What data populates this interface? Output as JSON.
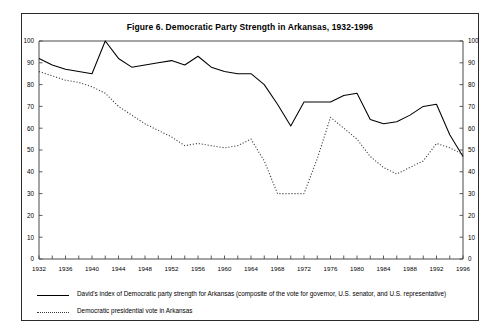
{
  "figure": {
    "title": "Figure 6.  Democratic Party Strength in Arkansas, 1932-1996"
  },
  "legend": {
    "items": [
      {
        "style": "solid",
        "label": "David's index of Democratic party strength for Arkansas (composite of the vote for governor, U.S. senator, and U.S. representative)"
      },
      {
        "style": "dotted",
        "label": "Democratic presidential vote in Arkansas"
      }
    ]
  },
  "chart_data": {
    "type": "line",
    "title": "Figure 6.  Democratic Party Strength in Arkansas, 1932-1996",
    "xlabel": "",
    "ylabel": "",
    "xlim": [
      1932,
      1996
    ],
    "ylim": [
      0,
      100
    ],
    "ytick_step": 10,
    "xtick_step": 4,
    "minor_xtick_step": 2,
    "grid": false,
    "legend_position": "below-plot",
    "dual_y_axis": true,
    "ytick_labels": [
      "0",
      "10",
      "20",
      "30",
      "40",
      "50",
      "60",
      "70",
      "80",
      "90",
      "100"
    ],
    "xtick_labels": [
      "1932",
      "1936",
      "1940",
      "1944",
      "1948",
      "1952",
      "1956",
      "1960",
      "1964",
      "1968",
      "1972",
      "1976",
      "1980",
      "1984",
      "1988",
      "1992",
      "1996"
    ],
    "x": [
      1932,
      1934,
      1936,
      1938,
      1940,
      1942,
      1944,
      1946,
      1948,
      1950,
      1952,
      1954,
      1956,
      1958,
      1960,
      1962,
      1964,
      1966,
      1968,
      1970,
      1972,
      1974,
      1976,
      1978,
      1980,
      1982,
      1984,
      1986,
      1988,
      1990,
      1992,
      1994,
      1996
    ],
    "series": [
      {
        "name": "David's index of Democratic party strength for Arkansas (composite of the vote for governor, U.S. senator, and U.S. representative)",
        "style": "solid",
        "color": "#000000",
        "values": [
          92,
          89,
          87,
          86,
          85,
          100,
          92,
          88,
          89,
          90,
          91,
          89,
          93,
          88,
          86,
          85,
          85,
          80,
          71,
          61,
          72,
          72,
          72,
          75,
          76,
          64,
          62,
          63,
          66,
          70,
          71,
          57,
          47
        ]
      },
      {
        "name": "Democratic presidential vote in Arkansas",
        "style": "dotted",
        "color": "#3a3a3a",
        "values": [
          86,
          84,
          82,
          81,
          79,
          76,
          70,
          66,
          62,
          59,
          56,
          52,
          53,
          52,
          51,
          52,
          55,
          45,
          30,
          30,
          30,
          46,
          65,
          60,
          55,
          47,
          42,
          39,
          42,
          45,
          53,
          51,
          48
        ]
      }
    ]
  }
}
